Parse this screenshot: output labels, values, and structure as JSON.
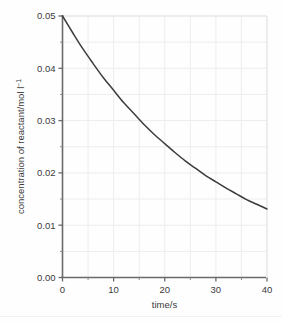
{
  "chart_data": {
    "type": "line",
    "title": "",
    "xlabel": "time/s",
    "ylabel": "concentration of reactant/mol l",
    "ylabel_superscript": "−1",
    "xlim": [
      0,
      40
    ],
    "ylim": [
      0,
      0.05
    ],
    "grid": true,
    "legend": null,
    "x_ticks": [
      0,
      10,
      20,
      30,
      40
    ],
    "x_tick_labels": [
      "0",
      "10",
      "20",
      "30",
      "40"
    ],
    "x_minor_ticks": [
      5,
      15,
      25,
      35
    ],
    "y_ticks": [
      0.0,
      0.01,
      0.02,
      0.03,
      0.04,
      0.05
    ],
    "y_tick_labels": [
      "0.00",
      "0.01",
      "0.02",
      "0.03",
      "0.04",
      "0.05"
    ],
    "y_minor_ticks": [
      0.005,
      0.015,
      0.025,
      0.035,
      0.045
    ],
    "series": [
      {
        "name": "concentration of reactant",
        "color": "#3c3c3c",
        "x": [
          0,
          2,
          4,
          6,
          8,
          10,
          12,
          14,
          16,
          18,
          20,
          22,
          24,
          26,
          28,
          30,
          32,
          34,
          36,
          38,
          40
        ],
        "y": [
          0.05,
          0.0468,
          0.0437,
          0.0409,
          0.0382,
          0.0358,
          0.0334,
          0.0313,
          0.0292,
          0.0273,
          0.0256,
          0.0239,
          0.0223,
          0.0209,
          0.0195,
          0.0183,
          0.0171,
          0.016,
          0.0149,
          0.014,
          0.0131
        ]
      }
    ]
  },
  "axis": {
    "x_label": "time/s",
    "y_label_main": "concentration of reactant/mol l",
    "y_label_sup": "−1"
  },
  "colors": {
    "curve": "#3c3c3c",
    "axis": "#6a6a6a",
    "grid": "#ededed",
    "text": "#3a3a3a",
    "background": "#fefefe"
  }
}
